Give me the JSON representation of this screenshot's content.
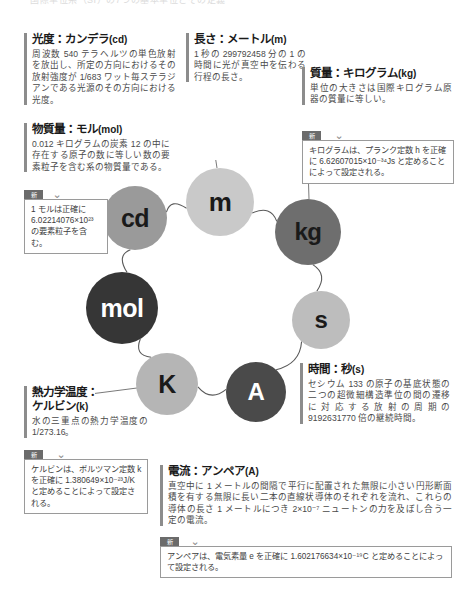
{
  "page": {
    "top_strip": "国際単位系（SI）の7つの基本単位とその定義"
  },
  "blocks": [
    {
      "id": "cd",
      "title": "光度：カンデラ",
      "unit": "(cd)",
      "text": "周波数 540 テラヘルツの単色放射を放出し、所定の方向におけるその放射強度が 1/683 ワット毎ステラジアンである光源のその方向における光度。"
    },
    {
      "id": "m",
      "title": "長さ：メートル",
      "unit": "(m)",
      "text": "1 秒の 299792458 分の 1 の時間に光が真空中を伝わる行程の長さ。"
    },
    {
      "id": "kg",
      "title": "質量：キログラム",
      "unit": "(kg)",
      "text": "単位の大きさは国際キログラム原器の質量に等しい。"
    },
    {
      "id": "mol",
      "title": "物質量：モル",
      "unit": "(mol)",
      "text": "0.012 キログラムの炭素 12 の中に存在する原子の数に等しい数の要素粒子を含む系の物質量である。"
    },
    {
      "id": "K",
      "title": "熱力学温度：",
      "title2": "ケルビン",
      "unit": "(k)",
      "text": "水の三重点の熱力学温度の 1/273.16。"
    },
    {
      "id": "s",
      "title": "時間：秒",
      "unit": "(s)",
      "text": "セシウム 133 の原子の基底状態の二つの超微細構造準位の間の遷移に対応する放射の周期の 9192631770 倍の継続時間。"
    },
    {
      "id": "A",
      "title": "電流：アンペア",
      "unit": "(A)",
      "text": "真空中に 1 メートルの間隔で平行に配置された無限に小さい円形断面積を有する無限に長い二本の直線状導体のそれぞれを流れ、これらの導体の長さ 1 メートルにつき 2×10⁻⁷ ニュートンの力を及ぼし合う一定の電流。"
    }
  ],
  "callouts": [
    {
      "id": "kg-new",
      "tag": "新",
      "text": "キログラムは、プランク定数 h を正確に 6.62607015×10⁻³⁴Js と定めることによって設定される。"
    },
    {
      "id": "mol-new",
      "tag": "新",
      "text": "1 モルは正確に 6.02214076×10²³ の要素粒子を含む。"
    },
    {
      "id": "K-new",
      "tag": "新",
      "text": "ケルビンは、ボルツマン定数 k を正確に 1.380649×10⁻²³J/K と定めることによって設定される。"
    },
    {
      "id": "A-new",
      "tag": "新",
      "text": "アンペアは、電気素量 e を正確に 1.602176634×10⁻¹⁹C と定めることによって設定される。"
    }
  ],
  "diagram": {
    "nodes": [
      {
        "id": "m",
        "label": "m",
        "color": "#c9c9c9",
        "text_color": "#1a1a1a"
      },
      {
        "id": "kg",
        "label": "kg",
        "color": "#6e6e6e",
        "text_color": "#1a1a1a"
      },
      {
        "id": "s",
        "label": "s",
        "color": "#bdbdbd",
        "text_color": "#1a1a1a"
      },
      {
        "id": "A",
        "label": "A",
        "color": "#4a4a4a",
        "text_color": "#ffffff"
      },
      {
        "id": "K",
        "label": "K",
        "color": "#b5b5b5",
        "text_color": "#1a1a1a"
      },
      {
        "id": "mol",
        "label": "mol",
        "color": "#363636",
        "text_color": "#ffffff"
      },
      {
        "id": "cd",
        "label": "cd",
        "color": "#9a9a9a",
        "text_color": "#1a1a1a"
      }
    ],
    "link_color": "#5a5a5a"
  },
  "colors": {
    "accent_bar": "#8c8c8c",
    "tag_bg": "#6b6b6b",
    "box_border": "#9a9a9a",
    "title": "#1a1a1a",
    "body_text": "#4a4a4a"
  }
}
